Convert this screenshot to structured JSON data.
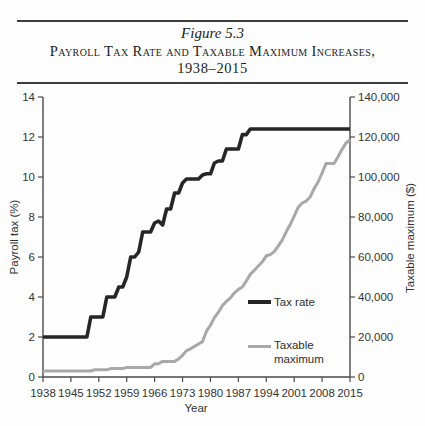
{
  "figure": {
    "number": "Figure 5.3",
    "title": "Payroll Tax Rate and Taxable Maximum Increases,",
    "subtitle": "1938–2015"
  },
  "chart_data": {
    "type": "line",
    "xlabel": "Year",
    "x_ticks": [
      1938,
      1945,
      1952,
      1959,
      1966,
      1973,
      1980,
      1987,
      1994,
      2001,
      2008,
      2015
    ],
    "left_axis": {
      "label": "Payroll tax (%)",
      "range": [
        0,
        14
      ],
      "ticks": [
        0,
        2,
        4,
        6,
        8,
        10,
        12,
        14
      ]
    },
    "right_axis": {
      "label": "Taxable maximum ($)",
      "range": [
        0,
        140000
      ],
      "tick_values": [
        0,
        20000,
        40000,
        60000,
        80000,
        100000,
        120000,
        140000
      ],
      "tick_labels": [
        "0",
        "20,000",
        "40,000",
        "60,000",
        "80,000",
        "100,000",
        "120,000",
        "140,000"
      ]
    },
    "axis_color": "#4a4a4a",
    "text_color": "#333333",
    "legend_position": "inside-lower-middle",
    "grid": false,
    "years": [
      1938,
      1939,
      1940,
      1941,
      1942,
      1943,
      1944,
      1945,
      1946,
      1947,
      1948,
      1949,
      1950,
      1951,
      1952,
      1953,
      1954,
      1955,
      1956,
      1957,
      1958,
      1959,
      1960,
      1961,
      1962,
      1963,
      1964,
      1965,
      1966,
      1967,
      1968,
      1969,
      1970,
      1971,
      1972,
      1973,
      1974,
      1975,
      1976,
      1977,
      1978,
      1979,
      1980,
      1981,
      1982,
      1983,
      1984,
      1985,
      1986,
      1987,
      1988,
      1989,
      1990,
      1991,
      1992,
      1993,
      1994,
      1995,
      1996,
      1997,
      1998,
      1999,
      2000,
      2001,
      2002,
      2003,
      2004,
      2005,
      2006,
      2007,
      2008,
      2009,
      2010,
      2011,
      2012,
      2013,
      2014,
      2015
    ],
    "series": [
      {
        "name": "Tax rate",
        "axis": "left",
        "color": "#262626",
        "width": 3.6,
        "values": [
          2,
          2,
          2,
          2,
          2,
          2,
          2,
          2,
          2,
          2,
          2,
          2,
          3,
          3,
          3,
          3,
          4,
          4,
          4,
          4.5,
          4.5,
          5,
          6,
          6,
          6.25,
          7.25,
          7.25,
          7.25,
          7.7,
          7.8,
          7.6,
          8.4,
          8.4,
          9.2,
          9.2,
          9.7,
          9.9,
          9.9,
          9.9,
          9.9,
          10.1,
          10.16,
          10.16,
          10.7,
          10.8,
          10.8,
          11.4,
          11.4,
          11.4,
          11.4,
          12.12,
          12.12,
          12.4,
          12.4,
          12.4,
          12.4,
          12.4,
          12.4,
          12.4,
          12.4,
          12.4,
          12.4,
          12.4,
          12.4,
          12.4,
          12.4,
          12.4,
          12.4,
          12.4,
          12.4,
          12.4,
          12.4,
          12.4,
          12.4,
          12.4,
          12.4,
          12.4,
          12.4
        ]
      },
      {
        "name": "Taxable maximum",
        "axis": "right",
        "color": "#a8a8a8",
        "width": 3,
        "values": [
          3000,
          3000,
          3000,
          3000,
          3000,
          3000,
          3000,
          3000,
          3000,
          3000,
          3000,
          3000,
          3000,
          3600,
          3600,
          3600,
          3600,
          4200,
          4200,
          4200,
          4200,
          4800,
          4800,
          4800,
          4800,
          4800,
          4800,
          4800,
          6600,
          6600,
          7800,
          7800,
          7800,
          7800,
          9000,
          10800,
          13200,
          14100,
          15300,
          16500,
          17700,
          22900,
          25900,
          29700,
          32400,
          35700,
          37800,
          39600,
          42000,
          43800,
          45000,
          48000,
          51300,
          53400,
          55500,
          57600,
          60600,
          61200,
          62700,
          65400,
          68400,
          72600,
          76200,
          80400,
          84900,
          87000,
          87900,
          90000,
          94200,
          97500,
          102000,
          106800,
          106800,
          106800,
          110100,
          113700,
          117000,
          118500
        ]
      }
    ]
  }
}
